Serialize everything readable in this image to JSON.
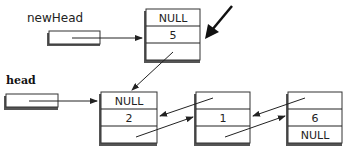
{
  "diagram": {
    "type": "doubly-linked-list-insert-at-head",
    "pointers": [
      {
        "id": "newHead",
        "label": "newHead",
        "points_to": "node_5"
      },
      {
        "id": "head",
        "label": "head",
        "points_to": "node_2"
      }
    ],
    "nodes": [
      {
        "id": "node_5",
        "prev": "NULL",
        "value": "5",
        "next": "node_2"
      },
      {
        "id": "node_2",
        "prev": "NULL",
        "value": "2",
        "next": "node_1"
      },
      {
        "id": "node_1",
        "prev": "node_2",
        "value": "1",
        "next": "node_6"
      },
      {
        "id": "node_6",
        "prev": "node_1",
        "value": "6",
        "next": "NULL"
      }
    ],
    "highlight_arrow": {
      "target": "node_5",
      "description": "new node being inserted"
    }
  },
  "labels": {
    "newHead": "newHead",
    "head": "head"
  },
  "cells": {
    "n5_prev": "NULL",
    "n5_val": "5",
    "n5_next": "",
    "n2_prev": "NULL",
    "n2_val": "2",
    "n2_next": "",
    "n1_prev": "",
    "n1_val": "1",
    "n1_next": "",
    "n6_prev": "",
    "n6_val": "6",
    "n6_next": "NULL"
  }
}
